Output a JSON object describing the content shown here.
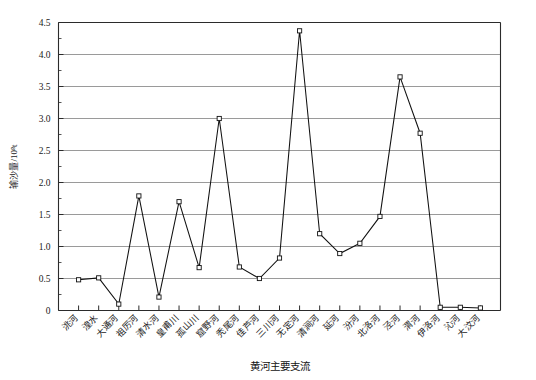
{
  "chart_data": {
    "type": "line",
    "title": "",
    "xlabel": "黄河主要支流",
    "ylabel": "输沙量/10⁸t",
    "ylim": [
      0,
      4.5
    ],
    "ytick_values": [
      0,
      0.5,
      1.0,
      1.5,
      2.0,
      2.5,
      3.0,
      3.5,
      4.0,
      4.5
    ],
    "ytick_labels": [
      "0",
      "0.5",
      "1.0",
      "1.5",
      "2.0",
      "2.5",
      "3.0",
      "3.5",
      "4.0",
      "4.5"
    ],
    "grid": "horizontal",
    "legend": "none",
    "marker": "open-square",
    "categories": [
      "洮河",
      "湟水",
      "大通河",
      "祖厉河",
      "清水河",
      "皇甫川",
      "孤山川",
      "窟野河",
      "秃尾河",
      "佳芦河",
      "三川河",
      "无定河",
      "清涧河",
      "延河",
      "汾河",
      "北洛河",
      "泾河",
      "渭河",
      "伊洛河",
      "沁河",
      "大汶河"
    ],
    "values": [
      0.48,
      0.51,
      0.1,
      1.79,
      0.21,
      1.7,
      0.67,
      3.0,
      0.68,
      0.5,
      0.82,
      4.37,
      1.2,
      0.89,
      1.05,
      1.47,
      3.65,
      2.77,
      0.05,
      0.05,
      0.04
    ],
    "series": [
      {
        "name": "输沙量",
        "values": [
          0.48,
          0.51,
          0.1,
          1.79,
          0.21,
          1.7,
          0.67,
          3.0,
          0.68,
          0.5,
          0.82,
          4.37,
          1.2,
          0.89,
          1.05,
          1.47,
          3.65,
          2.77,
          0.05,
          0.05,
          0.04
        ]
      }
    ]
  }
}
